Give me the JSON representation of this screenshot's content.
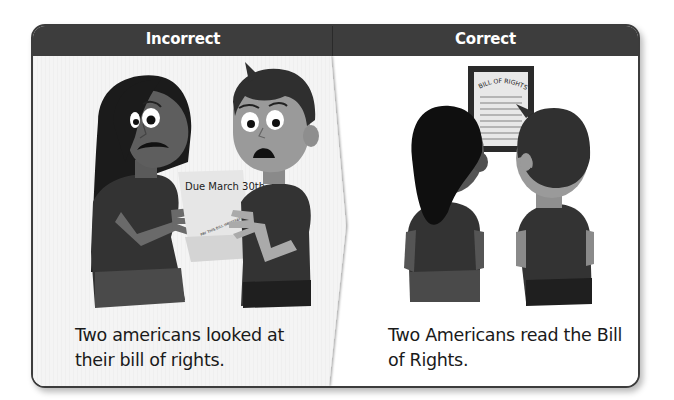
{
  "header": {
    "left_label": "Incorrect",
    "right_label": "Correct"
  },
  "panels": {
    "incorrect": {
      "illustration": "two-people-reading-bill-illustration",
      "paper_title": "Due March 30th",
      "paper_subtext": "PAY THIS BILL IMMEDIATELY",
      "caption_line1": "Two americans looked at",
      "caption_line2": "their bill of rights."
    },
    "correct": {
      "illustration": "two-people-reading-bill-of-rights-illustration",
      "document_title": "BILL OF RIGHTS",
      "caption_line1": "Two Americans read the Bill",
      "caption_line2": "of Rights."
    }
  },
  "colors": {
    "header_bg": "#3d3d3d",
    "header_text": "#ffffff",
    "frame_border": "#3c3c3c",
    "left_panel_bg": "#f3f3f3",
    "right_panel_bg": "#ffffff",
    "caption_text": "#1a1a1a"
  }
}
